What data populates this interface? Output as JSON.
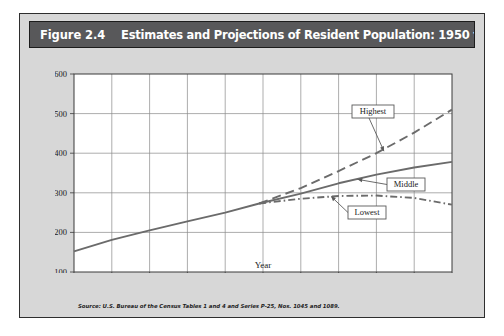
{
  "figure": {
    "number": "Figure 2.4",
    "title": "Estimates and Projections of Resident Population: 1950 to 2050",
    "source": "Source: U.S. Bureau of the Census Tables 1 and 4 and Series P-25, Nos. 1045 and 1089.",
    "banner_color": "#58585a",
    "panel_color": "#d7d7d7",
    "plot_color": "#ffffff",
    "line_color": "#6b6b6b",
    "grid_color": "#8c8c8c"
  },
  "chart_data": {
    "type": "line",
    "title": "Estimates and Projections of Resident Population: 1950 to 2050",
    "xlabel": "Year",
    "ylabel": "(in millions)",
    "xlim": [
      1950,
      2050
    ],
    "ylim": [
      100,
      600
    ],
    "xticks": [
      "1950",
      "1960",
      "1970",
      "1980",
      "1990",
      "2000",
      "2010",
      "2020",
      "2030",
      "2040",
      "2050"
    ],
    "yticks": [
      "100",
      "200",
      "300",
      "400",
      "500",
      "600"
    ],
    "grid": true,
    "legend_position": "inline-callouts",
    "series": [
      {
        "name": "Estimates",
        "style": "solid",
        "x": [
          1950,
          1960,
          1970,
          1980,
          1990,
          1999
        ],
        "values": [
          152,
          181,
          205,
          228,
          250,
          273
        ]
      },
      {
        "name": "Highest",
        "style": "dashed",
        "x": [
          1999,
          2010,
          2020,
          2030,
          2040,
          2050
        ],
        "values": [
          273,
          312,
          355,
          400,
          452,
          510
        ]
      },
      {
        "name": "Middle",
        "style": "solid",
        "x": [
          1999,
          2010,
          2020,
          2030,
          2040,
          2050
        ],
        "values": [
          273,
          298,
          324,
          346,
          364,
          378
        ]
      },
      {
        "name": "Lowest",
        "style": "dash-dot",
        "x": [
          1999,
          2010,
          2020,
          2030,
          2040,
          2050
        ],
        "values": [
          273,
          285,
          292,
          293,
          287,
          270
        ]
      }
    ],
    "annotations": [
      {
        "label": "Highest",
        "points_to_year": 2032,
        "points_to_value": 405
      },
      {
        "label": "Middle",
        "points_to_year": 2025,
        "points_to_value": 334
      },
      {
        "label": "Lowest",
        "points_to_year": 2018,
        "points_to_value": 291
      }
    ]
  }
}
